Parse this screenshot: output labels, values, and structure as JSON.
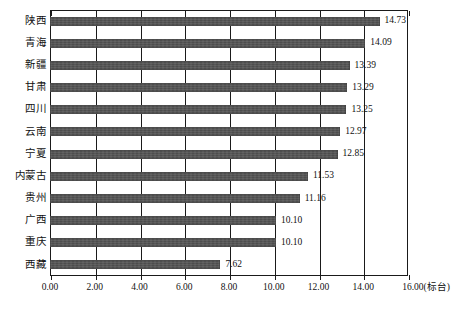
{
  "chart_data": {
    "type": "bar",
    "orientation": "horizontal",
    "title": "",
    "subtitle": "",
    "xlabel": "(标台)",
    "ylabel": "",
    "unit": "标台",
    "xlim": [
      0.0,
      16.0
    ],
    "xticks": [
      "0.00",
      "2.00",
      "4.00",
      "6.00",
      "8.00",
      "10.00",
      "12.00",
      "14.00",
      "16.00"
    ],
    "xtick_values": [
      0,
      2,
      4,
      6,
      8,
      10,
      12,
      14,
      16
    ],
    "last_tick_label": "16.00(标台)",
    "grid": "vertical",
    "legend": "none",
    "categories": [
      "陕西",
      "青海",
      "新疆",
      "甘肃",
      "四川",
      "云南",
      "宁夏",
      "内蒙古",
      "贵州",
      "广西",
      "重庆",
      "西藏"
    ],
    "values": [
      14.73,
      14.09,
      13.39,
      13.29,
      13.25,
      12.97,
      12.85,
      11.53,
      11.16,
      10.1,
      10.1,
      7.62
    ],
    "value_labels": [
      "14.73",
      "14.09",
      "13.39",
      "13.29",
      "13.25",
      "12.97",
      "12.85",
      "11.53",
      "11.16",
      "10.10",
      "10.10",
      "7.62"
    ],
    "series": [
      {
        "name": "",
        "values": [
          14.73,
          14.09,
          13.39,
          13.29,
          13.25,
          12.97,
          12.85,
          11.53,
          11.16,
          10.1,
          10.1,
          7.62
        ]
      }
    ],
    "colors": {
      "bar": "#4d4d4d",
      "axis": "#1a1a1a",
      "grid": "#1a1a1a",
      "text": "#111111",
      "background": "#ffffff"
    }
  }
}
